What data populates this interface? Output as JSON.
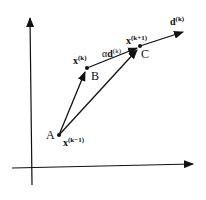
{
  "diagram": {
    "title": "",
    "points": {
      "A": {
        "label": "A",
        "math": "x",
        "sup": "(k−1)"
      },
      "B": {
        "label": "B",
        "math": "x",
        "sup": "(k)"
      },
      "C": {
        "label": "C",
        "math": "x",
        "sup": "(k+1)"
      }
    },
    "step": {
      "alpha": "α",
      "d": "d",
      "sup": "(k)"
    },
    "direction": {
      "d": "d",
      "sup": "(k)"
    },
    "colors": {
      "ink": "#111111",
      "background": "#ffffff"
    }
  }
}
